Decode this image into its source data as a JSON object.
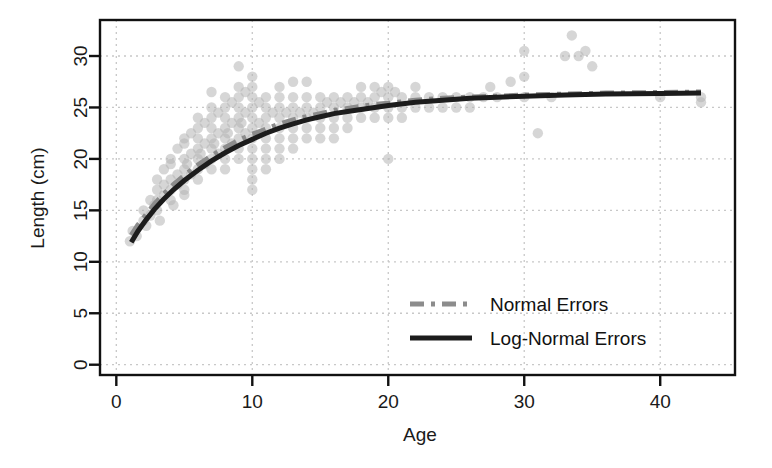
{
  "chart_data": {
    "type": "scatter",
    "title": "",
    "xlabel": "Age",
    "ylabel": "Length (cm)",
    "xlim": [
      -1.2,
      45.5
    ],
    "ylim": [
      -1.0,
      33.5
    ],
    "xticks": [
      0,
      10,
      20,
      30,
      40
    ],
    "yticks": [
      0,
      5,
      10,
      15,
      20,
      25,
      30
    ],
    "grid": true,
    "grid_style": "dotted",
    "grid_color": "#c8c8c8",
    "legend_position": "center-right",
    "point_color": "#b4b4b4",
    "point_opacity": 0.55,
    "point_radius": 5.2,
    "series": [
      {
        "name": "Normal Errors",
        "type": "line",
        "style": "dashed",
        "color": "#8c8c8c",
        "width": 5,
        "dash": "14,7,4,7",
        "points": [
          [
            1.1,
            12.6
          ],
          [
            1.6,
            13.6
          ],
          [
            2.2,
            14.6
          ],
          [
            2.8,
            15.6
          ],
          [
            3.5,
            16.6
          ],
          [
            4.2,
            17.5
          ],
          [
            5.0,
            18.4
          ],
          [
            6.0,
            19.4
          ],
          [
            7.0,
            20.3
          ],
          [
            8.0,
            21.1
          ],
          [
            9.0,
            21.8
          ],
          [
            10.0,
            22.4
          ],
          [
            11.0,
            22.9
          ],
          [
            12.0,
            23.4
          ],
          [
            13.0,
            23.8
          ],
          [
            14.0,
            24.1
          ],
          [
            15.0,
            24.4
          ],
          [
            16.0,
            24.7
          ],
          [
            17.0,
            24.9
          ],
          [
            18.0,
            25.1
          ],
          [
            19.0,
            25.3
          ],
          [
            20.0,
            25.4
          ],
          [
            22.0,
            25.7
          ],
          [
            24.0,
            25.9
          ],
          [
            26.0,
            26.0
          ],
          [
            28.0,
            26.1
          ],
          [
            30.0,
            26.2
          ],
          [
            33.0,
            26.3
          ],
          [
            36.0,
            26.4
          ],
          [
            40.0,
            26.45
          ],
          [
            43.0,
            26.5
          ]
        ]
      },
      {
        "name": "Log-Normal Errors",
        "type": "line",
        "style": "solid",
        "color": "#1c1c1c",
        "width": 5,
        "dash": "",
        "points": [
          [
            1.1,
            11.9
          ],
          [
            1.6,
            13.0
          ],
          [
            2.2,
            14.1
          ],
          [
            2.8,
            15.1
          ],
          [
            3.5,
            16.1
          ],
          [
            4.2,
            17.0
          ],
          [
            5.0,
            17.9
          ],
          [
            6.0,
            18.9
          ],
          [
            7.0,
            19.8
          ],
          [
            8.0,
            20.6
          ],
          [
            9.0,
            21.3
          ],
          [
            10.0,
            21.9
          ],
          [
            11.0,
            22.5
          ],
          [
            12.0,
            23.0
          ],
          [
            13.0,
            23.4
          ],
          [
            14.0,
            23.8
          ],
          [
            15.0,
            24.1
          ],
          [
            16.0,
            24.4
          ],
          [
            17.0,
            24.6
          ],
          [
            18.0,
            24.8
          ],
          [
            19.0,
            25.0
          ],
          [
            20.0,
            25.2
          ],
          [
            22.0,
            25.5
          ],
          [
            24.0,
            25.7
          ],
          [
            26.0,
            25.9
          ],
          [
            28.0,
            26.0
          ],
          [
            30.0,
            26.1
          ],
          [
            33.0,
            26.2
          ],
          [
            36.0,
            26.3
          ],
          [
            40.0,
            26.35
          ],
          [
            43.0,
            26.4
          ]
        ]
      }
    ],
    "scatter_points": [
      [
        1.0,
        12.0
      ],
      [
        1.2,
        13.0
      ],
      [
        1.5,
        12.5
      ],
      [
        2.0,
        14.0
      ],
      [
        2.0,
        15.0
      ],
      [
        2.2,
        13.5
      ],
      [
        2.5,
        16.0
      ],
      [
        2.5,
        14.5
      ],
      [
        2.8,
        15.5
      ],
      [
        3.0,
        17.0
      ],
      [
        3.0,
        16.0
      ],
      [
        3.0,
        15.0
      ],
      [
        3.0,
        18.0
      ],
      [
        3.2,
        14.0
      ],
      [
        3.5,
        17.5
      ],
      [
        3.5,
        16.5
      ],
      [
        3.5,
        19.0
      ],
      [
        4.0,
        18.0
      ],
      [
        4.0,
        17.0
      ],
      [
        4.0,
        19.5
      ],
      [
        4.0,
        16.0
      ],
      [
        4.0,
        20.0
      ],
      [
        4.2,
        15.5
      ],
      [
        4.5,
        18.5
      ],
      [
        4.5,
        21.0
      ],
      [
        4.5,
        17.5
      ],
      [
        5.0,
        19.0
      ],
      [
        5.0,
        20.0
      ],
      [
        5.0,
        18.0
      ],
      [
        5.0,
        21.5
      ],
      [
        5.0,
        17.0
      ],
      [
        5.0,
        22.0
      ],
      [
        5.0,
        16.5
      ],
      [
        5.2,
        19.5
      ],
      [
        5.5,
        20.5
      ],
      [
        5.5,
        18.5
      ],
      [
        5.5,
        22.5
      ],
      [
        6.0,
        20.0
      ],
      [
        6.0,
        21.0
      ],
      [
        6.0,
        19.0
      ],
      [
        6.0,
        22.0
      ],
      [
        6.0,
        23.0
      ],
      [
        6.0,
        18.0
      ],
      [
        6.0,
        24.0
      ],
      [
        6.2,
        20.5
      ],
      [
        6.5,
        21.5
      ],
      [
        6.5,
        19.5
      ],
      [
        6.5,
        23.5
      ],
      [
        7.0,
        21.0
      ],
      [
        7.0,
        22.0
      ],
      [
        7.0,
        20.0
      ],
      [
        7.0,
        23.0
      ],
      [
        7.0,
        24.0
      ],
      [
        7.0,
        19.0
      ],
      [
        7.0,
        25.0
      ],
      [
        7.0,
        26.5
      ],
      [
        7.2,
        21.5
      ],
      [
        7.5,
        22.5
      ],
      [
        7.5,
        20.5
      ],
      [
        7.5,
        24.5
      ],
      [
        8.0,
        22.0
      ],
      [
        8.0,
        23.0
      ],
      [
        8.0,
        21.0
      ],
      [
        8.0,
        24.0
      ],
      [
        8.0,
        25.0
      ],
      [
        8.0,
        20.0
      ],
      [
        8.0,
        26.0
      ],
      [
        8.0,
        19.0
      ],
      [
        8.2,
        22.5
      ],
      [
        8.5,
        23.5
      ],
      [
        8.5,
        21.5
      ],
      [
        8.5,
        25.5
      ],
      [
        9.0,
        23.0
      ],
      [
        9.0,
        24.0
      ],
      [
        9.0,
        22.0
      ],
      [
        9.0,
        25.0
      ],
      [
        9.0,
        26.0
      ],
      [
        9.0,
        21.0
      ],
      [
        9.0,
        27.0
      ],
      [
        9.0,
        20.0
      ],
      [
        9.0,
        29.0
      ],
      [
        9.2,
        23.5
      ],
      [
        9.5,
        24.5
      ],
      [
        9.5,
        22.5
      ],
      [
        9.5,
        26.5
      ],
      [
        10.0,
        23.0
      ],
      [
        10.0,
        24.0
      ],
      [
        10.0,
        25.0
      ],
      [
        10.0,
        22.0
      ],
      [
        10.0,
        26.0
      ],
      [
        10.0,
        21.0
      ],
      [
        10.0,
        27.0
      ],
      [
        10.0,
        20.0
      ],
      [
        10.0,
        28.0
      ],
      [
        10.0,
        19.0
      ],
      [
        10.0,
        18.0
      ],
      [
        10.0,
        17.0
      ],
      [
        10.5,
        23.5
      ],
      [
        10.5,
        25.5
      ],
      [
        11.0,
        24.0
      ],
      [
        11.0,
        23.0
      ],
      [
        11.0,
        25.0
      ],
      [
        11.0,
        22.0
      ],
      [
        11.0,
        21.0
      ],
      [
        11.0,
        20.0
      ],
      [
        11.0,
        26.0
      ],
      [
        11.0,
        19.0
      ],
      [
        11.5,
        24.5
      ],
      [
        12.0,
        24.0
      ],
      [
        12.0,
        23.0
      ],
      [
        12.0,
        25.0
      ],
      [
        12.0,
        22.0
      ],
      [
        12.0,
        26.0
      ],
      [
        12.0,
        21.0
      ],
      [
        12.0,
        20.0
      ],
      [
        12.0,
        27.0
      ],
      [
        12.5,
        24.5
      ],
      [
        13.0,
        24.0
      ],
      [
        13.0,
        23.0
      ],
      [
        13.0,
        25.0
      ],
      [
        13.0,
        22.0
      ],
      [
        13.0,
        26.0
      ],
      [
        13.0,
        21.0
      ],
      [
        13.0,
        27.5
      ],
      [
        13.5,
        24.5
      ],
      [
        14.0,
        24.0
      ],
      [
        14.0,
        25.0
      ],
      [
        14.0,
        23.0
      ],
      [
        14.0,
        26.0
      ],
      [
        14.0,
        22.0
      ],
      [
        14.0,
        27.5
      ],
      [
        14.5,
        24.5
      ],
      [
        15.0,
        25.0
      ],
      [
        15.0,
        24.0
      ],
      [
        15.0,
        23.0
      ],
      [
        15.0,
        26.0
      ],
      [
        15.0,
        22.0
      ],
      [
        15.5,
        25.5
      ],
      [
        16.0,
        25.0
      ],
      [
        16.0,
        24.0
      ],
      [
        16.0,
        26.0
      ],
      [
        16.0,
        23.0
      ],
      [
        16.0,
        22.0
      ],
      [
        16.5,
        25.5
      ],
      [
        17.0,
        25.0
      ],
      [
        17.0,
        26.0
      ],
      [
        17.0,
        24.0
      ],
      [
        17.0,
        23.0
      ],
      [
        17.5,
        25.5
      ],
      [
        18.0,
        25.0
      ],
      [
        18.0,
        26.0
      ],
      [
        18.0,
        24.0
      ],
      [
        18.0,
        27.0
      ],
      [
        18.5,
        25.5
      ],
      [
        19.0,
        26.0
      ],
      [
        19.0,
        25.0
      ],
      [
        19.0,
        27.0
      ],
      [
        19.0,
        24.0
      ],
      [
        19.5,
        26.5
      ],
      [
        20.0,
        26.0
      ],
      [
        20.0,
        25.0
      ],
      [
        20.0,
        27.0
      ],
      [
        20.0,
        24.0
      ],
      [
        20.0,
        20.0
      ],
      [
        20.5,
        26.5
      ],
      [
        21.0,
        26.0
      ],
      [
        21.0,
        25.0
      ],
      [
        21.0,
        24.0
      ],
      [
        22.0,
        26.0
      ],
      [
        22.0,
        25.0
      ],
      [
        22.0,
        27.0
      ],
      [
        23.0,
        26.0
      ],
      [
        23.0,
        25.0
      ],
      [
        24.0,
        26.0
      ],
      [
        24.0,
        25.0
      ],
      [
        25.0,
        26.0
      ],
      [
        25.0,
        25.0
      ],
      [
        26.0,
        26.0
      ],
      [
        26.0,
        25.0
      ],
      [
        27.0,
        26.0
      ],
      [
        27.5,
        27.0
      ],
      [
        28.0,
        26.0
      ],
      [
        29.0,
        27.5
      ],
      [
        30.0,
        26.0
      ],
      [
        30.0,
        28.0
      ],
      [
        30.0,
        30.5
      ],
      [
        31.0,
        22.5
      ],
      [
        32.0,
        26.0
      ],
      [
        33.0,
        30.0
      ],
      [
        33.5,
        32.0
      ],
      [
        34.0,
        30.0
      ],
      [
        34.5,
        30.5
      ],
      [
        35.0,
        29.0
      ],
      [
        40.0,
        26.0
      ],
      [
        43.0,
        26.0
      ],
      [
        43.0,
        25.5
      ]
    ]
  },
  "legend": {
    "items": [
      {
        "label": "Normal Errors"
      },
      {
        "label": "Log-Normal Errors"
      }
    ]
  }
}
